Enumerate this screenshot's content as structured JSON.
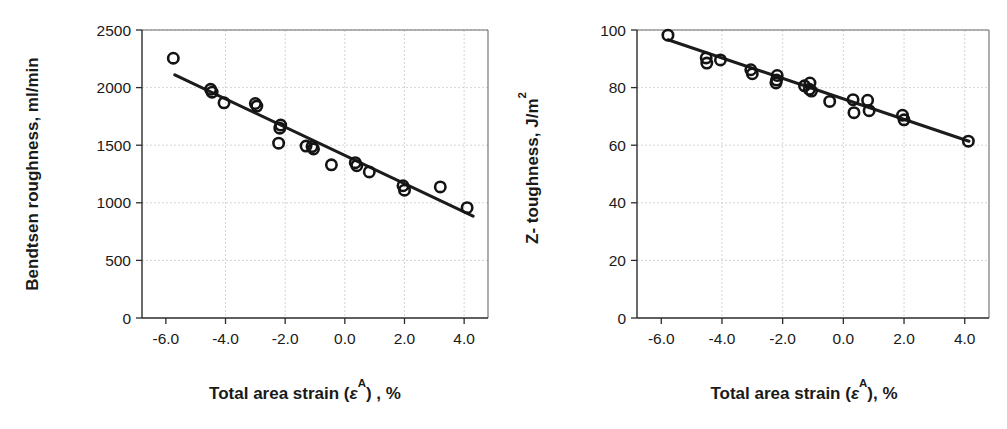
{
  "figure": {
    "background_color": "#ffffff",
    "marker_color": "#141414",
    "line_color": "#1c1c1c",
    "grid_color": "#c9c9c9",
    "axis_color": "#2b2b2b"
  },
  "panels": [
    {
      "id": "left",
      "name": "bendtsen-roughness-chart"
    },
    {
      "id": "right",
      "name": "z-toughness-chart"
    }
  ],
  "chart_data": [
    {
      "type": "scatter",
      "title": "",
      "subtitle": "",
      "xlabel": "Total area strain (εA) , %",
      "xlabel_parts": {
        "prefix": "Total area strain (",
        "symbol": "ε",
        "superscript": "A",
        "suffix": ") , %"
      },
      "ylabel": "Bendtsen roughness, ml/min",
      "xlim": [
        -6.8,
        4.8
      ],
      "ylim": [
        0,
        2500
      ],
      "xticks": [
        -6.0,
        -4.0,
        -2.0,
        0.0,
        2.0,
        4.0
      ],
      "xticklabels": [
        "-6.0",
        "-4.0",
        "-2.0",
        "0.0",
        "2.0",
        "4.0"
      ],
      "yticks": [
        0,
        500,
        1000,
        1500,
        2000,
        2500
      ],
      "yticklabels": [
        "0",
        "500",
        "1000",
        "1500",
        "2000",
        "2500"
      ],
      "grid": true,
      "legend": "none",
      "marker_style": "open-circle",
      "points": [
        {
          "x": -5.75,
          "y": 2255
        },
        {
          "x": -4.5,
          "y": 1985
        },
        {
          "x": -4.45,
          "y": 1960
        },
        {
          "x": -4.05,
          "y": 1868
        },
        {
          "x": -3.0,
          "y": 1862
        },
        {
          "x": -2.95,
          "y": 1840
        },
        {
          "x": -2.15,
          "y": 1675
        },
        {
          "x": -2.18,
          "y": 1648
        },
        {
          "x": -2.22,
          "y": 1518
        },
        {
          "x": -1.3,
          "y": 1492
        },
        {
          "x": -1.1,
          "y": 1488
        },
        {
          "x": -1.05,
          "y": 1468
        },
        {
          "x": -0.45,
          "y": 1330
        },
        {
          "x": 0.35,
          "y": 1348
        },
        {
          "x": 0.4,
          "y": 1322
        },
        {
          "x": 0.82,
          "y": 1268
        },
        {
          "x": 1.95,
          "y": 1148
        },
        {
          "x": 2.0,
          "y": 1110
        },
        {
          "x": 3.2,
          "y": 1138
        },
        {
          "x": 4.1,
          "y": 958
        }
      ],
      "fit_line": {
        "name": "linear-regression-line",
        "x_start": -5.7,
        "y_start": 2110,
        "x_end": 4.3,
        "y_end": 885
      }
    },
    {
      "type": "scatter",
      "title": "",
      "subtitle": "",
      "xlabel": "Total area strain (εA), %",
      "xlabel_parts": {
        "prefix": "Total area strain (",
        "symbol": "ε",
        "superscript": "A",
        "suffix": "), %"
      },
      "ylabel": "Z- toughness, J/m2",
      "ylabel_parts": {
        "prefix": "Z- toughness, J/m",
        "superscript": "2"
      },
      "xlim": [
        -6.8,
        4.8
      ],
      "ylim": [
        0,
        100
      ],
      "xticks": [
        -6.0,
        -4.0,
        -2.0,
        0.0,
        2.0,
        4.0
      ],
      "xticklabels": [
        "-6.0",
        "-4.0",
        "-2.0",
        "0.0",
        "2.0",
        "4.0"
      ],
      "yticks": [
        0,
        20,
        40,
        60,
        80,
        100
      ],
      "yticklabels": [
        "0",
        "20",
        "40",
        "60",
        "80",
        "100"
      ],
      "grid": true,
      "legend": "none",
      "marker_style": "open-circle",
      "points": [
        {
          "x": -5.78,
          "y": 98.2
        },
        {
          "x": -4.52,
          "y": 90.3
        },
        {
          "x": -4.5,
          "y": 88.5
        },
        {
          "x": -4.05,
          "y": 89.6
        },
        {
          "x": -3.05,
          "y": 86.2
        },
        {
          "x": -3.0,
          "y": 84.8
        },
        {
          "x": -2.18,
          "y": 84.2
        },
        {
          "x": -2.2,
          "y": 82.6
        },
        {
          "x": -2.22,
          "y": 81.6
        },
        {
          "x": -1.28,
          "y": 80.6
        },
        {
          "x": -1.1,
          "y": 81.6
        },
        {
          "x": -1.12,
          "y": 79.4
        },
        {
          "x": -1.05,
          "y": 78.8
        },
        {
          "x": -0.45,
          "y": 75.2
        },
        {
          "x": 0.32,
          "y": 75.8
        },
        {
          "x": 0.35,
          "y": 71.3
        },
        {
          "x": 0.8,
          "y": 75.6
        },
        {
          "x": 0.85,
          "y": 72.0
        },
        {
          "x": 1.95,
          "y": 70.4
        },
        {
          "x": 2.0,
          "y": 68.8
        },
        {
          "x": 4.12,
          "y": 61.4
        }
      ],
      "fit_line": {
        "name": "linear-regression-line",
        "x_start": -5.78,
        "y_start": 96.6,
        "x_end": 4.14,
        "y_end": 61.4
      }
    }
  ]
}
